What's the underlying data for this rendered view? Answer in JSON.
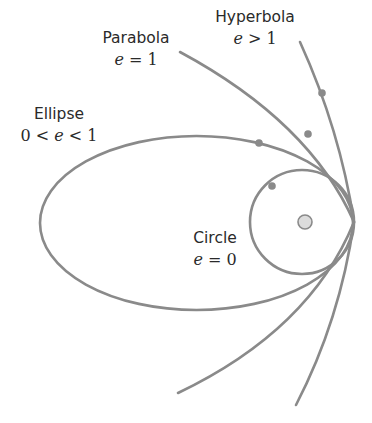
{
  "diagram": {
    "colors": {
      "curve": "#8a8a8a",
      "dot": "#8a8a8a",
      "sun_fill": "#dcdcdc",
      "sun_stroke": "#8a8a8a",
      "text": "#2a2a2a"
    },
    "labels": {
      "parabola": {
        "name": "Parabola",
        "var": "e",
        "rel": " = 1"
      },
      "hyperbola": {
        "name": "Hyperbola",
        "var": "e",
        "rel": " > 1"
      },
      "ellipse": {
        "name": "Ellipse",
        "pre": "0 < ",
        "var": "e",
        "rel": " < 1"
      },
      "circle": {
        "name": "Circle",
        "var": "e",
        "rel": " = 0"
      }
    },
    "curves": {
      "ellipse": {
        "cx": 196.5,
        "cy": 223,
        "rx": 156.5,
        "ry": 87
      },
      "circle": {
        "cx": 302,
        "cy": 222,
        "r": 52
      },
      "parabola": "M 180 52 Q 310 122 354 222 Q 310 330 178 393",
      "hyperbola": "M 300 42 Q 340 130 354 222 Q 340 320 296 405"
    },
    "focus": {
      "cx": 305,
      "cy": 222,
      "r": 7
    },
    "bodies": [
      {
        "orbit": "ellipse",
        "cx": 259,
        "cy": 143
      },
      {
        "orbit": "circle",
        "cx": 272,
        "cy": 186
      },
      {
        "orbit": "parabola",
        "cx": 308,
        "cy": 134
      },
      {
        "orbit": "hyperbola",
        "cx": 322,
        "cy": 93
      }
    ]
  }
}
